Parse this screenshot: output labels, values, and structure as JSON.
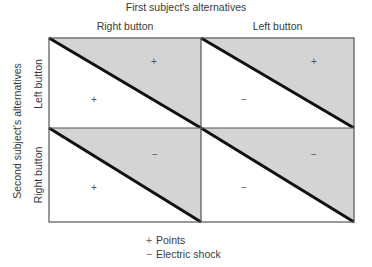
{
  "title": "First subject's alternatives",
  "columns": [
    {
      "label": "Right button"
    },
    {
      "label": "Left button"
    }
  ],
  "row_title": "Second subject's alternatives",
  "rows": [
    {
      "label": "Left button"
    },
    {
      "label": "Right button"
    }
  ],
  "cells": [
    {
      "row": "Left button",
      "col": "Right button",
      "upper_symbol": "+",
      "lower_symbol": "+"
    },
    {
      "row": "Left button",
      "col": "Left button",
      "upper_symbol": "+",
      "lower_symbol": "−"
    },
    {
      "row": "Right button",
      "col": "Right button",
      "upper_symbol": "−",
      "lower_symbol": "+"
    },
    {
      "row": "Right button",
      "col": "Left button",
      "upper_symbol": "−",
      "lower_symbol": "−"
    }
  ],
  "legend": [
    {
      "symbol": "+",
      "label": "Points"
    },
    {
      "symbol": "−",
      "label": "Electric shock"
    }
  ],
  "colors": {
    "shaded": "#d4d4d4",
    "diagonal": "#111111",
    "border": "#555555"
  }
}
